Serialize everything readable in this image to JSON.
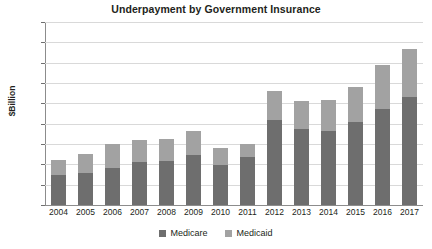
{
  "chart_data": {
    "type": "bar",
    "subtype": "stacked-bar",
    "title": "Underpayment by Government Insurance",
    "xlabel": "",
    "ylabel": "$Billion",
    "ylim": [
      0,
      90
    ],
    "ytick_step": 10,
    "yticks": [
      90,
      80,
      70,
      60,
      50,
      40,
      30,
      20,
      10,
      0
    ],
    "grid": true,
    "legend_position": "bottom-center",
    "categories": [
      "2004",
      "2005",
      "2006",
      "2007",
      "2008",
      "2009",
      "2010",
      "2011",
      "2012",
      "2013",
      "2014",
      "2015",
      "2016",
      "2017"
    ],
    "series": [
      {
        "name": "Medicare",
        "color": "#6e6e6e",
        "values": [
          14.8,
          15.5,
          18.3,
          21.3,
          21.6,
          24.7,
          19.6,
          23.5,
          42.0,
          37.3,
          36.3,
          41.0,
          47.0,
          53.0
        ]
      },
      {
        "name": "Medicaid",
        "color": "#a2a2a2",
        "values": [
          7.2,
          9.5,
          11.7,
          10.7,
          10.7,
          11.6,
          8.2,
          6.3,
          14.0,
          14.0,
          15.3,
          17.0,
          22.0,
          23.5
        ]
      }
    ],
    "totals": [
      22.0,
      25.0,
      30.0,
      32.0,
      32.3,
      36.3,
      27.8,
      29.8,
      56.0,
      51.3,
      51.6,
      58.0,
      69.0,
      76.5
    ]
  },
  "colors": {
    "medicare": "#6e6e6e",
    "medicaid": "#a2a2a2",
    "gridline": "#d9d9d9",
    "axis": "#8c8c8c",
    "text": "#231f20",
    "background": "#ffffff"
  },
  "legend": {
    "items": [
      {
        "label": "Medicare",
        "color": "#6e6e6e"
      },
      {
        "label": "Medicaid",
        "color": "#a2a2a2"
      }
    ]
  }
}
